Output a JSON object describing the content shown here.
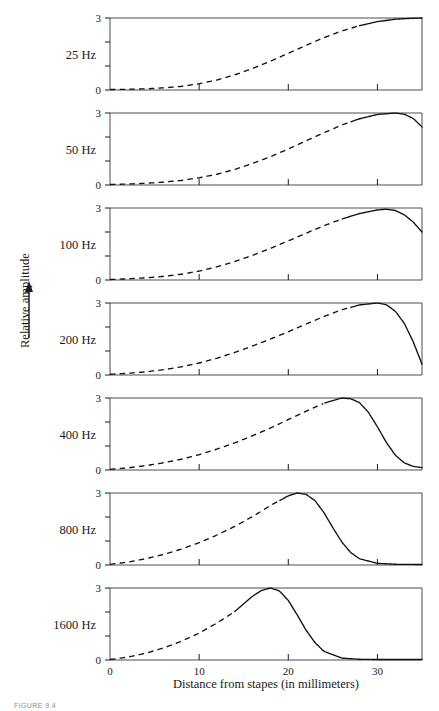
{
  "figure": {
    "caption": "FIGURE 9.4",
    "y_axis_label": "Relative amplitude",
    "y_axis_arrow": "up-arrow",
    "x_axis_label": "Distance from stapes (in millimeters)"
  },
  "chart_data": {
    "type": "line",
    "title": "",
    "subtitle": "",
    "xlabel": "Distance from stapes (in millimeters)",
    "ylabel": "Relative amplitude",
    "xlim": [
      0,
      35
    ],
    "ylim": [
      0,
      3
    ],
    "xticks": [
      0,
      10,
      20,
      30
    ],
    "xtick_labels": [
      "0",
      "10",
      "20",
      "30"
    ],
    "yticks": [
      0,
      1,
      2,
      3
    ],
    "ytick_labels": [
      "0",
      "",
      "",
      "3"
    ],
    "grid": false,
    "legend": "none",
    "panel_note": "Each panel shares the same x and y axes; the dashed portion marks the rising envelope and the solid portion marks the peak and decay.",
    "panels": [
      {
        "label": "25 Hz",
        "frequency_hz": 25,
        "peak_position_mm": 35,
        "peak_amplitude": 3,
        "dash_end_mm": 28,
        "x": [
          0,
          2,
          4,
          6,
          8,
          10,
          12,
          14,
          16,
          18,
          20,
          22,
          24,
          26,
          28,
          30,
          32,
          34,
          35
        ],
        "y": [
          0.02,
          0.03,
          0.05,
          0.09,
          0.15,
          0.26,
          0.42,
          0.63,
          0.9,
          1.2,
          1.53,
          1.86,
          2.18,
          2.46,
          2.68,
          2.85,
          2.95,
          2.99,
          3.0
        ]
      },
      {
        "label": "50 Hz",
        "frequency_hz": 50,
        "peak_position_mm": 32,
        "peak_amplitude": 3,
        "dash_end_mm": 27,
        "x": [
          0,
          2,
          4,
          6,
          8,
          10,
          12,
          14,
          16,
          18,
          20,
          22,
          24,
          26,
          28,
          30,
          32,
          33,
          34,
          35
        ],
        "y": [
          0.02,
          0.04,
          0.07,
          0.12,
          0.19,
          0.3,
          0.45,
          0.65,
          0.9,
          1.18,
          1.5,
          1.84,
          2.18,
          2.5,
          2.76,
          2.94,
          3.0,
          2.95,
          2.78,
          2.42
        ]
      },
      {
        "label": "100 Hz",
        "frequency_hz": 100,
        "peak_position_mm": 31,
        "peak_amplitude": 2.95,
        "dash_end_mm": 26,
        "x": [
          0,
          2,
          4,
          6,
          8,
          10,
          12,
          14,
          16,
          18,
          20,
          22,
          24,
          26,
          28,
          30,
          31,
          32,
          33,
          34,
          35
        ],
        "y": [
          0.02,
          0.05,
          0.09,
          0.15,
          0.24,
          0.37,
          0.55,
          0.77,
          1.03,
          1.32,
          1.63,
          1.95,
          2.26,
          2.54,
          2.77,
          2.92,
          2.95,
          2.9,
          2.72,
          2.42,
          2.0
        ]
      },
      {
        "label": "200 Hz",
        "frequency_hz": 200,
        "peak_position_mm": 30,
        "peak_amplitude": 3,
        "dash_end_mm": 27,
        "x": [
          0,
          2,
          4,
          6,
          8,
          10,
          12,
          14,
          16,
          18,
          20,
          22,
          24,
          26,
          28,
          30,
          31,
          32,
          33,
          34,
          35
        ],
        "y": [
          0.03,
          0.07,
          0.13,
          0.22,
          0.34,
          0.5,
          0.7,
          0.94,
          1.21,
          1.5,
          1.8,
          2.12,
          2.44,
          2.72,
          2.92,
          3.0,
          2.93,
          2.66,
          2.16,
          1.4,
          0.45
        ]
      },
      {
        "label": "400 Hz",
        "frequency_hz": 400,
        "peak_position_mm": 26,
        "peak_amplitude": 3,
        "dash_end_mm": 24,
        "x": [
          0,
          2,
          4,
          6,
          8,
          10,
          12,
          14,
          16,
          18,
          20,
          22,
          24,
          26,
          27,
          28,
          29,
          30,
          31,
          32,
          33,
          34,
          35
        ],
        "y": [
          0.03,
          0.09,
          0.18,
          0.3,
          0.45,
          0.64,
          0.87,
          1.13,
          1.43,
          1.75,
          2.1,
          2.45,
          2.78,
          3.0,
          2.97,
          2.8,
          2.4,
          1.8,
          1.15,
          0.62,
          0.3,
          0.15,
          0.1
        ]
      },
      {
        "label": "800 Hz",
        "frequency_hz": 800,
        "peak_position_mm": 21,
        "peak_amplitude": 3,
        "dash_end_mm": 19,
        "x": [
          0,
          2,
          4,
          6,
          8,
          10,
          12,
          14,
          16,
          18,
          20,
          21,
          22,
          23,
          24,
          25,
          26,
          27,
          28,
          30,
          32,
          35
        ],
        "y": [
          0.03,
          0.12,
          0.26,
          0.44,
          0.66,
          0.93,
          1.25,
          1.61,
          2.02,
          2.48,
          2.88,
          3.0,
          2.94,
          2.68,
          2.18,
          1.55,
          0.96,
          0.52,
          0.26,
          0.07,
          0.03,
          0.02
        ]
      },
      {
        "label": "1600 Hz",
        "frequency_hz": 1600,
        "peak_position_mm": 18,
        "peak_amplitude": 3,
        "dash_end_mm": 14,
        "x": [
          0,
          2,
          4,
          6,
          8,
          10,
          12,
          14,
          16,
          17,
          18,
          19,
          20,
          21,
          22,
          23,
          24,
          26,
          28,
          30,
          32,
          35
        ],
        "y": [
          0.02,
          0.12,
          0.28,
          0.5,
          0.78,
          1.12,
          1.54,
          2.02,
          2.66,
          2.9,
          3.0,
          2.88,
          2.48,
          1.88,
          1.24,
          0.72,
          0.36,
          0.08,
          0.03,
          0.02,
          0.02,
          0.02
        ]
      }
    ]
  }
}
